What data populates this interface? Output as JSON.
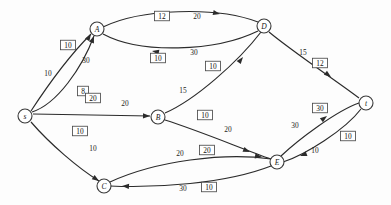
{
  "figure": {
    "kind": "network-flow-diagram",
    "background_color": "#fdfdfd",
    "stroke_color": "#2b2b2b",
    "width": 391,
    "height": 205
  },
  "nodes": [
    {
      "id": "s",
      "label": "s",
      "x": 25,
      "y": 116,
      "r": 7.0
    },
    {
      "id": "A",
      "label": "A",
      "x": 97,
      "y": 29,
      "r": 7.0
    },
    {
      "id": "B",
      "label": "B",
      "x": 158,
      "y": 117,
      "r": 7.0
    },
    {
      "id": "C",
      "label": "C",
      "x": 104,
      "y": 186,
      "r": 7.0
    },
    {
      "id": "D",
      "label": "D",
      "x": 264,
      "y": 26,
      "r": 7.0
    },
    {
      "id": "E",
      "label": "E",
      "x": 277,
      "y": 162,
      "r": 7.0
    },
    {
      "id": "t",
      "label": "t",
      "x": 366,
      "y": 103,
      "r": 7.0
    }
  ],
  "edges": [
    {
      "id": "s-A-upper",
      "from": "s",
      "to": "A",
      "capacity": "10",
      "flow": "10",
      "path": "M 31 111 C 46 88 70 55 91 34",
      "arrow": {
        "x": 91,
        "y": 34,
        "angle": -57
      },
      "capacity_label": {
        "x": 48,
        "y": 73
      },
      "flow_box": {
        "x": 68,
        "y": 45
      }
    },
    {
      "id": "s-A-lower",
      "from": "s",
      "to": "A",
      "capacity": "30",
      "flow": "8",
      "path": "M 32 112 C 57 104 82 68 94 36",
      "arrow": {
        "x": 94,
        "y": 36,
        "angle": -69
      },
      "capacity_label": {
        "x": 86,
        "y": 60
      },
      "flow_box": {
        "x": 83,
        "y": 91
      }
    },
    {
      "id": "s-B",
      "from": "s",
      "to": "B",
      "capacity": "20",
      "flow": "20",
      "path": "M 33 114 L 150 116",
      "arrow": {
        "x": 150,
        "y": 116,
        "angle": 1
      },
      "capacity_label": {
        "x": 125,
        "y": 103
      },
      "flow_box": {
        "x": 93,
        "y": 98
      }
    },
    {
      "id": "s-C",
      "from": "s",
      "to": "C",
      "capacity": "10",
      "flow": "10",
      "path": "M 31 122 C 50 144 78 168 99 181",
      "arrow": {
        "x": 99,
        "y": 181,
        "angle": 34
      },
      "capacity_label": {
        "x": 93,
        "y": 148
      },
      "flow_box": {
        "x": 80,
        "y": 131
      }
    },
    {
      "id": "A-D",
      "from": "A",
      "to": "D",
      "capacity": "20",
      "flow": "12",
      "path": "M 103 27 C 140 9 215 6 258 22",
      "arrow": {
        "x": 220,
        "y": 14,
        "angle": 12
      },
      "capacity_label": {
        "x": 197,
        "y": 16
      },
      "flow_box": {
        "x": 162,
        "y": 16
      }
    },
    {
      "id": "D-A",
      "from": "D",
      "to": "A",
      "capacity": "30",
      "flow": "10",
      "path": "M 258 31 C 215 52 140 54 103 34",
      "arrow": {
        "x": 152,
        "y": 51,
        "angle": 190
      },
      "capacity_label": {
        "x": 194,
        "y": 52
      },
      "flow_box": {
        "x": 158,
        "y": 58
      }
    },
    {
      "id": "B-D",
      "from": "B",
      "to": "D",
      "capacity": "15",
      "flow": "10",
      "path": "M 165 113 C 195 100 238 62 261 32",
      "arrow": {
        "x": 243,
        "y": 57,
        "angle": -52
      },
      "capacity_label": {
        "x": 183,
        "y": 90
      },
      "flow_box": {
        "x": 213,
        "y": 66
      }
    },
    {
      "id": "B-E",
      "from": "B",
      "to": "E",
      "capacity": "20",
      "flow": "10",
      "path": "M 165 120 C 200 131 245 150 271 159",
      "arrow": {
        "x": 250,
        "y": 152,
        "angle": 22
      },
      "capacity_label": {
        "x": 228,
        "y": 129
      },
      "flow_box": {
        "x": 205,
        "y": 115
      }
    },
    {
      "id": "D-t",
      "from": "D",
      "to": "t",
      "capacity": "15",
      "flow": "12",
      "path": "M 269 32 C 293 52 338 82 359 98",
      "arrow": {
        "x": 331,
        "y": 77,
        "angle": 37
      },
      "capacity_label": {
        "x": 303,
        "y": 52
      },
      "flow_box": {
        "x": 320,
        "y": 63
      }
    },
    {
      "id": "C-E",
      "from": "C",
      "to": "E",
      "capacity": "20",
      "flow": "20",
      "path": "M 110 182 C 155 161 225 152 271 159",
      "arrow": {
        "x": 262,
        "y": 157,
        "angle": 9
      },
      "capacity_label": {
        "x": 180,
        "y": 153
      },
      "flow_box": {
        "x": 207,
        "y": 150
      }
    },
    {
      "id": "E-C",
      "from": "E",
      "to": "C",
      "capacity": "30",
      "flow": "10",
      "path": "M 271 166 C 225 184 155 188 110 186",
      "arrow": {
        "x": 122,
        "y": 186,
        "angle": 183
      },
      "capacity_label": {
        "x": 183,
        "y": 188
      },
      "flow_box": {
        "x": 209,
        "y": 187
      }
    },
    {
      "id": "E-t",
      "from": "E",
      "to": "t",
      "capacity": "30",
      "flow": "30",
      "path": "M 281 156 C 298 140 336 111 359 103",
      "arrow": {
        "x": 327,
        "y": 116,
        "angle": -37
      },
      "capacity_label": {
        "x": 295,
        "y": 125
      },
      "flow_box": {
        "x": 320,
        "y": 108
      }
    },
    {
      "id": "t-E",
      "from": "t",
      "to": "E",
      "capacity": "10",
      "flow": "10",
      "path": "M 361 109 C 345 130 305 155 283 162",
      "arrow": {
        "x": 300,
        "y": 156,
        "angle": 160
      },
      "capacity_label": {
        "x": 315,
        "y": 150
      },
      "flow_box": {
        "x": 348,
        "y": 136
      }
    }
  ]
}
